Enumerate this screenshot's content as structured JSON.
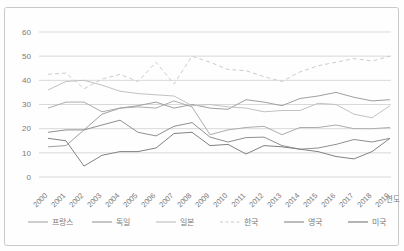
{
  "figure": {
    "border_color": "#c9c9c9",
    "background": "#fefefe",
    "gridline_color": "#d9d9d9",
    "tick_color": "#7a7a7a",
    "x_axis_label": "연도"
  },
  "chart_data": {
    "type": "line",
    "title": "",
    "xlabel": "연도",
    "ylabel": "",
    "ylim": [
      0,
      60
    ],
    "yticks": [
      0,
      10,
      20,
      30,
      40,
      50,
      60
    ],
    "grid": "horizontal",
    "legend_position": "bottom",
    "categories": [
      2000,
      2001,
      2002,
      2003,
      2004,
      2005,
      2006,
      2007,
      2008,
      2009,
      2010,
      2011,
      2012,
      2013,
      2014,
      2015,
      2016,
      2017,
      2018,
      2019
    ],
    "series": [
      {
        "name": "프랑스",
        "color": "#adadad",
        "dashed": false,
        "values": [
          28.5,
          31,
          31,
          27,
          28.5,
          29,
          28.5,
          31.5,
          29,
          17.5,
          19.5,
          20.5,
          21,
          17.5,
          20.5,
          20.5,
          21.5,
          20,
          20,
          20.5
        ]
      },
      {
        "name": "독일",
        "color": "#a0a0a0",
        "dashed": false,
        "values": [
          12.5,
          13,
          19.5,
          26,
          28.5,
          29.5,
          31,
          28.5,
          30,
          28.5,
          28,
          32,
          31,
          29.5,
          32.5,
          33.5,
          35,
          33,
          31.5,
          32
        ]
      },
      {
        "name": "일본",
        "color": "#c2c2c2",
        "dashed": false,
        "values": [
          36,
          39.5,
          40,
          38,
          35.5,
          34.5,
          34,
          33.5,
          29.5,
          30,
          29,
          28.5,
          27,
          27.5,
          27.5,
          30.5,
          30,
          26,
          24.5,
          29.5
        ]
      },
      {
        "name": "한국",
        "color": "#cccccc",
        "dashed": true,
        "values": [
          42.5,
          43,
          36.5,
          40.5,
          42.5,
          39.5,
          47.5,
          38.5,
          50,
          47.5,
          44.5,
          44,
          41.5,
          39.5,
          43.5,
          46,
          47.5,
          49,
          48,
          50
        ]
      },
      {
        "name": "영국",
        "color": "#909090",
        "dashed": false,
        "values": [
          18.5,
          19.5,
          19.5,
          21.5,
          23.5,
          18.5,
          17,
          21,
          22.5,
          16.5,
          14.5,
          16.3,
          16.5,
          13,
          11.5,
          12,
          13.5,
          15.5,
          14.5,
          16
        ]
      },
      {
        "name": "미국",
        "color": "#828282",
        "dashed": false,
        "values": [
          16,
          15,
          4.5,
          9,
          10.5,
          10.5,
          12,
          18,
          18.5,
          13,
          13.5,
          9.5,
          13,
          12.5,
          11.5,
          10.5,
          8.5,
          7.5,
          10.5,
          16
        ]
      }
    ]
  }
}
